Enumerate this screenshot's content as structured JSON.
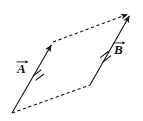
{
  "figure": {
    "background_color": "#ffffff",
    "line_color": "#1a1a1a",
    "width": 143,
    "height": 121
  },
  "labels": {
    "vector_a": "A",
    "vector_b": "B",
    "vector_a_icon": "arrow-overbar-icon",
    "vector_b_icon": "arrow-overbar-icon"
  },
  "chart_data": {
    "type": "diagram",
    "coordinate_space": {
      "width": 143,
      "height": 121,
      "origin": "top-left"
    },
    "vertices": {
      "bottom_left": [
        12,
        113
      ],
      "top_left": [
        53,
        42
      ],
      "bottom_right": [
        90,
        85
      ],
      "top_right": [
        131,
        13
      ]
    },
    "edges": [
      {
        "name": "vector-a",
        "from": [
          12,
          113
        ],
        "to": [
          53,
          42
        ],
        "style": "solid",
        "arrowhead": "end",
        "label": "A",
        "tick_marks": 2
      },
      {
        "name": "vector-b",
        "from": [
          90,
          85
        ],
        "to": [
          131,
          13
        ],
        "style": "solid",
        "arrowhead": "end",
        "label": "B",
        "tick_marks": 2
      },
      {
        "name": "bottom-dashed-edge",
        "from": [
          12,
          113
        ],
        "to": [
          90,
          85
        ],
        "style": "dashed",
        "arrowhead": "none",
        "label": "",
        "tick_marks": 0
      },
      {
        "name": "top-dashed-edge",
        "from": [
          53,
          42
        ],
        "to": [
          131,
          13
        ],
        "style": "dashed",
        "arrowhead": "end",
        "label": "",
        "tick_marks": 0
      }
    ],
    "annotations": [
      {
        "name": "tick-mark-a",
        "at": [
          38,
          70
        ],
        "meaning": "equal-length mark"
      },
      {
        "name": "tick-mark-b",
        "at": [
          105,
          52
        ],
        "meaning": "equal-length mark"
      }
    ]
  }
}
